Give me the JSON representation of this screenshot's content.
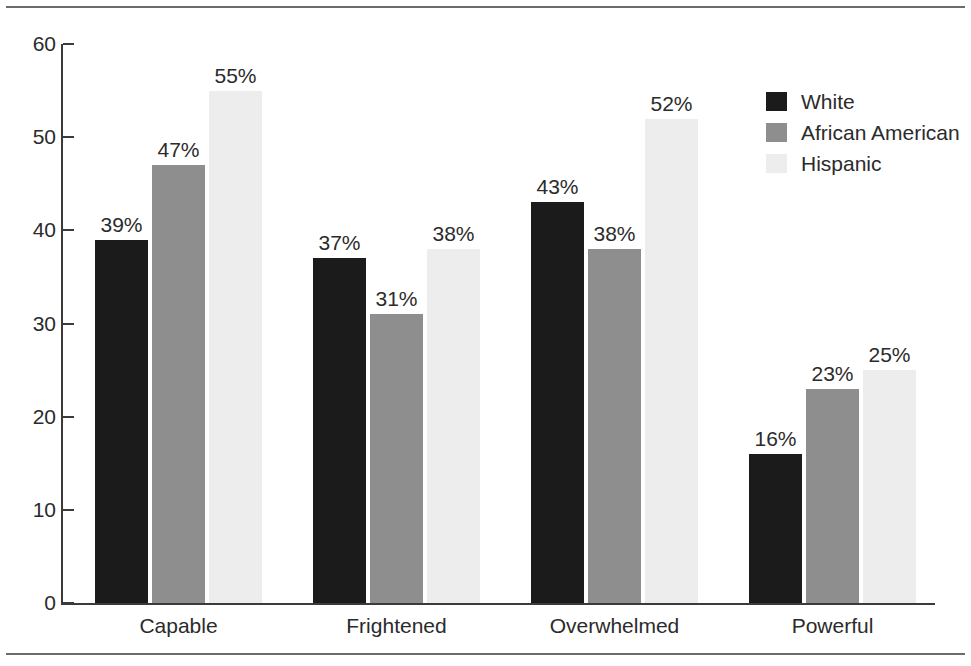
{
  "chart_data": {
    "type": "bar",
    "title": "",
    "xlabel": "",
    "ylabel": "",
    "ylim": [
      0,
      60
    ],
    "yticks": [
      0,
      10,
      20,
      30,
      40,
      50,
      60
    ],
    "ytick_labels": [
      "0",
      "10",
      "20",
      "30",
      "40",
      "50",
      "60"
    ],
    "grid": false,
    "legend_position": "right",
    "categories": [
      "Capable",
      "Frightened",
      "Overwhelmed",
      "Powerful"
    ],
    "series": [
      {
        "name": "White",
        "color": "#1b1b1b",
        "values": [
          39,
          37,
          43,
          16
        ],
        "labels": [
          "39%",
          "37%",
          "43%",
          "16%"
        ]
      },
      {
        "name": "African American",
        "color": "#8e8e8e",
        "values": [
          47,
          31,
          38,
          23
        ],
        "labels": [
          "47%",
          "31%",
          "38%",
          "23%"
        ]
      },
      {
        "name": "Hispanic",
        "color": "#ededed",
        "values": [
          55,
          38,
          52,
          25
        ],
        "labels": [
          "55%",
          "38%",
          "52%",
          "25%"
        ]
      }
    ]
  },
  "legend": {
    "items": [
      {
        "label": "White",
        "color": "#1b1b1b"
      },
      {
        "label": "African American",
        "color": "#8e8e8e"
      },
      {
        "label": "Hispanic",
        "color": "#ededed"
      }
    ]
  },
  "axes": {
    "y_tick_labels": [
      "60",
      "50",
      "40",
      "30",
      "20",
      "10",
      "0"
    ],
    "x_tick_labels": [
      "Capable",
      "Frightened",
      "Overwhelmed",
      "Powerful"
    ]
  },
  "colors": {
    "axis": "#3b3b3b",
    "rule": "#6b6b6b",
    "text": "#2b2b2b",
    "background": "#ffffff"
  }
}
